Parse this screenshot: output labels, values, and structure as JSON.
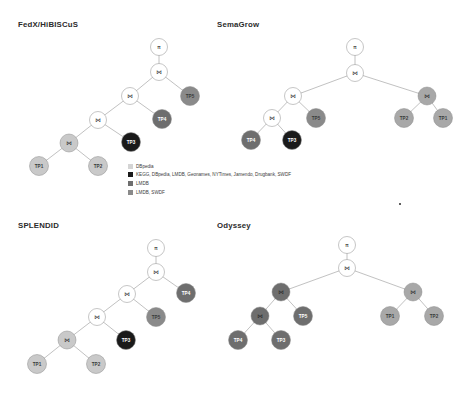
{
  "figure": {
    "speck_marker": "·"
  },
  "legend": {
    "entries": [
      {
        "label": "DBpedia",
        "color": "#d4d4d4"
      },
      {
        "label": "KEGG, DBpedia, LMDB, Geonames, NYTimes, Jamendo, Drugbank, SWDF",
        "color": "#1a1a1a"
      },
      {
        "label": "LMDB",
        "color": "#6e6e6e"
      },
      {
        "label": "LMDB, SWDF",
        "color": "#8a8a8a"
      }
    ]
  },
  "palette": {
    "dbpedia": "#d4d4d4",
    "all_sources": "#1a1a1a",
    "lmdb": "#6e6e6e",
    "lmdb_swdf": "#8a8a8a",
    "operator_node": "#ffffff",
    "edge": "#8d8d8d"
  },
  "icons": {
    "projection": "π",
    "join": "⋈"
  },
  "panels": [
    {
      "id": "fedx",
      "title": "FedX/HiBISCuS",
      "nodes": [
        {
          "name": "root-projection",
          "label": "π",
          "type": "op",
          "x": 159,
          "y": 47,
          "r": 8.5,
          "fill": "#ffffff"
        },
        {
          "name": "join-1",
          "label": "⋈",
          "type": "op",
          "x": 159,
          "y": 72,
          "r": 8.5,
          "fill": "#ffffff"
        },
        {
          "name": "join-2",
          "label": "⋈",
          "type": "op",
          "x": 130,
          "y": 96,
          "r": 8.5,
          "fill": "#ffffff"
        },
        {
          "name": "tp5",
          "label": "TP5",
          "type": "leaf",
          "x": 190,
          "y": 96,
          "r": 9.5,
          "fill": "#8a8a8a"
        },
        {
          "name": "join-3",
          "label": "⋈",
          "type": "op",
          "x": 98,
          "y": 120,
          "r": 8.5,
          "fill": "#ffffff"
        },
        {
          "name": "tp4",
          "label": "TP4",
          "type": "leaf",
          "x": 162,
          "y": 119,
          "r": 9.5,
          "fill": "#6e6e6e"
        },
        {
          "name": "join-4",
          "label": "⋈",
          "type": "op",
          "x": 69,
          "y": 143,
          "r": 9.0,
          "fill": "#c9c9c9"
        },
        {
          "name": "tp3",
          "label": "TP3",
          "type": "leaf",
          "x": 131,
          "y": 142,
          "r": 9.5,
          "fill": "#1a1a1a"
        },
        {
          "name": "tp1",
          "label": "TP1",
          "type": "leaf",
          "x": 39,
          "y": 166,
          "r": 9.5,
          "fill": "#c9c9c9"
        },
        {
          "name": "tp2",
          "label": "TP2",
          "type": "leaf",
          "x": 98,
          "y": 166,
          "r": 9.5,
          "fill": "#c9c9c9"
        }
      ],
      "edges": [
        [
          "root-projection",
          "join-1"
        ],
        [
          "join-1",
          "join-2"
        ],
        [
          "join-1",
          "tp5"
        ],
        [
          "join-2",
          "join-3"
        ],
        [
          "join-2",
          "tp4"
        ],
        [
          "join-3",
          "join-4"
        ],
        [
          "join-3",
          "tp3"
        ],
        [
          "join-4",
          "tp1"
        ],
        [
          "join-4",
          "tp2"
        ]
      ]
    },
    {
      "id": "semagrow",
      "title": "SemaGrow",
      "nodes": [
        {
          "name": "root-projection",
          "label": "π",
          "type": "op",
          "x": 355,
          "y": 47,
          "r": 8.5,
          "fill": "#ffffff"
        },
        {
          "name": "join-1",
          "label": "⋈",
          "type": "op",
          "x": 355,
          "y": 73,
          "r": 8.5,
          "fill": "#ffffff"
        },
        {
          "name": "join-2",
          "label": "⋈",
          "type": "op",
          "x": 293,
          "y": 96,
          "r": 8.5,
          "fill": "#ffffff"
        },
        {
          "name": "join-right",
          "label": "⋈",
          "type": "op",
          "x": 427,
          "y": 96,
          "r": 9.0,
          "fill": "#a8a8a8"
        },
        {
          "name": "join-3",
          "label": "⋈",
          "type": "op",
          "x": 272,
          "y": 118,
          "r": 8.5,
          "fill": "#ffffff"
        },
        {
          "name": "tp5",
          "label": "TP5",
          "type": "leaf",
          "x": 316,
          "y": 118,
          "r": 9.5,
          "fill": "#8a8a8a"
        },
        {
          "name": "tp2",
          "label": "TP2",
          "type": "leaf",
          "x": 404,
          "y": 118,
          "r": 9.5,
          "fill": "#a8a8a8"
        },
        {
          "name": "tp1",
          "label": "TP1",
          "type": "leaf",
          "x": 443,
          "y": 118,
          "r": 9.5,
          "fill": "#a8a8a8"
        },
        {
          "name": "tp4",
          "label": "TP4",
          "type": "leaf",
          "x": 251,
          "y": 140,
          "r": 9.5,
          "fill": "#6e6e6e"
        },
        {
          "name": "tp3",
          "label": "TP3",
          "type": "leaf",
          "x": 292,
          "y": 140,
          "r": 9.5,
          "fill": "#1a1a1a"
        }
      ],
      "edges": [
        [
          "root-projection",
          "join-1"
        ],
        [
          "join-1",
          "join-2"
        ],
        [
          "join-1",
          "join-right"
        ],
        [
          "join-2",
          "join-3"
        ],
        [
          "join-2",
          "tp5"
        ],
        [
          "join-right",
          "tp2"
        ],
        [
          "join-right",
          "tp1"
        ],
        [
          "join-3",
          "tp4"
        ],
        [
          "join-3",
          "tp3"
        ]
      ]
    },
    {
      "id": "splendid",
      "title": "SPLENDID",
      "nodes": [
        {
          "name": "root-projection",
          "label": "π",
          "type": "op",
          "x": 156,
          "y": 248,
          "r": 8.5,
          "fill": "#ffffff"
        },
        {
          "name": "join-1",
          "label": "⋈",
          "type": "op",
          "x": 156,
          "y": 272,
          "r": 8.5,
          "fill": "#ffffff"
        },
        {
          "name": "join-2",
          "label": "⋈",
          "type": "op",
          "x": 127,
          "y": 294,
          "r": 8.5,
          "fill": "#ffffff"
        },
        {
          "name": "tp4",
          "label": "TP4",
          "type": "leaf",
          "x": 186,
          "y": 293,
          "r": 9.5,
          "fill": "#6e6e6e"
        },
        {
          "name": "join-3",
          "label": "⋈",
          "type": "op",
          "x": 97,
          "y": 317,
          "r": 8.5,
          "fill": "#ffffff"
        },
        {
          "name": "tp5",
          "label": "TP5",
          "type": "leaf",
          "x": 156,
          "y": 317,
          "r": 9.5,
          "fill": "#8a8a8a"
        },
        {
          "name": "join-4",
          "label": "⋈",
          "type": "op",
          "x": 67,
          "y": 340,
          "r": 9.0,
          "fill": "#c9c9c9"
        },
        {
          "name": "tp3",
          "label": "TP3",
          "type": "leaf",
          "x": 126,
          "y": 340,
          "r": 9.5,
          "fill": "#1a1a1a"
        },
        {
          "name": "tp1",
          "label": "TP1",
          "type": "leaf",
          "x": 37,
          "y": 364,
          "r": 9.5,
          "fill": "#c9c9c9"
        },
        {
          "name": "tp2",
          "label": "TP2",
          "type": "leaf",
          "x": 96,
          "y": 364,
          "r": 9.5,
          "fill": "#c9c9c9"
        }
      ],
      "edges": [
        [
          "root-projection",
          "join-1"
        ],
        [
          "join-1",
          "join-2"
        ],
        [
          "join-1",
          "tp4"
        ],
        [
          "join-2",
          "join-3"
        ],
        [
          "join-2",
          "tp5"
        ],
        [
          "join-3",
          "join-4"
        ],
        [
          "join-3",
          "tp3"
        ],
        [
          "join-4",
          "tp1"
        ],
        [
          "join-4",
          "tp2"
        ]
      ]
    },
    {
      "id": "odyssey",
      "title": "Odyssey",
      "nodes": [
        {
          "name": "root-projection",
          "label": "π",
          "type": "op",
          "x": 347,
          "y": 245,
          "r": 8.5,
          "fill": "#ffffff"
        },
        {
          "name": "join-1",
          "label": "⋈",
          "type": "op",
          "x": 347,
          "y": 268,
          "r": 8.5,
          "fill": "#ffffff"
        },
        {
          "name": "join-left",
          "label": "⋈",
          "type": "op",
          "x": 281,
          "y": 292,
          "r": 9.0,
          "fill": "#6e6e6e"
        },
        {
          "name": "join-right",
          "label": "⋈",
          "type": "op",
          "x": 413,
          "y": 292,
          "r": 9.0,
          "fill": "#a8a8a8"
        },
        {
          "name": "join-left-2",
          "label": "⋈",
          "type": "op",
          "x": 260,
          "y": 316,
          "r": 9.0,
          "fill": "#6e6e6e"
        },
        {
          "name": "tp5",
          "label": "TP5",
          "type": "leaf",
          "x": 303,
          "y": 316,
          "r": 9.5,
          "fill": "#6e6e6e"
        },
        {
          "name": "tp1",
          "label": "TP1",
          "type": "leaf",
          "x": 390,
          "y": 316,
          "r": 9.5,
          "fill": "#a8a8a8"
        },
        {
          "name": "tp2",
          "label": "TP2",
          "type": "leaf",
          "x": 434,
          "y": 316,
          "r": 9.5,
          "fill": "#a8a8a8"
        },
        {
          "name": "tp4",
          "label": "TP4",
          "type": "leaf",
          "x": 238,
          "y": 340,
          "r": 9.5,
          "fill": "#6e6e6e"
        },
        {
          "name": "tp3",
          "label": "TP3",
          "type": "leaf",
          "x": 281,
          "y": 340,
          "r": 9.5,
          "fill": "#6e6e6e"
        }
      ],
      "edges": [
        [
          "root-projection",
          "join-1"
        ],
        [
          "join-1",
          "join-left"
        ],
        [
          "join-1",
          "join-right"
        ],
        [
          "join-left",
          "join-left-2"
        ],
        [
          "join-left",
          "tp5"
        ],
        [
          "join-right",
          "tp1"
        ],
        [
          "join-right",
          "tp2"
        ],
        [
          "join-left-2",
          "tp4"
        ],
        [
          "join-left-2",
          "tp3"
        ]
      ]
    }
  ],
  "panel_titles": {
    "fedx": {
      "x": 18,
      "y": 20
    },
    "semagrow": {
      "x": 217,
      "y": 20
    },
    "splendid": {
      "x": 18,
      "y": 221
    },
    "odyssey": {
      "x": 217,
      "y": 221
    }
  }
}
